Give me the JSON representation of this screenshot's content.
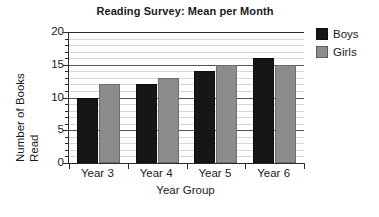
{
  "chart_data": {
    "type": "bar",
    "title": "Reading Survey: Mean per Month",
    "xlabel": "Year Group",
    "ylabel": "Number of Books Read",
    "ylabel_line1": "Number of Books",
    "ylabel_line2": "Read",
    "categories": [
      "Year 3",
      "Year 4",
      "Year 5",
      "Year 6"
    ],
    "series": [
      {
        "name": "Boys",
        "color": "#161616",
        "values": [
          10,
          12,
          14,
          16
        ]
      },
      {
        "name": "Girls",
        "color": "#8c8c8c",
        "values": [
          12,
          13,
          15,
          15
        ]
      }
    ],
    "ylim": [
      0,
      20
    ],
    "ytick_labels": [
      "0",
      "5",
      "10",
      "15",
      "20"
    ],
    "ytick_values": [
      0,
      5,
      10,
      15,
      20
    ],
    "yminor_step": 1,
    "grid": true,
    "grid_axis": "y",
    "legend_position": "right"
  },
  "legend": {
    "entries": [
      {
        "label": "Boys",
        "swatch": "boys-swatch"
      },
      {
        "label": "Girls",
        "swatch": "girls-swatch"
      }
    ]
  }
}
